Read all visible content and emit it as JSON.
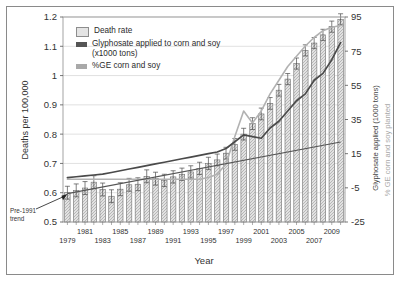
{
  "figure": {
    "frame_border_color": "#8a8a8a"
  },
  "chart_data": {
    "type": "bar",
    "title": "",
    "xlabel": "Year",
    "ylabel": "Deaths per 100,000",
    "y2label_dark": "Glyphosate applied (1000 tons)",
    "y2label_light": "% GE corn and soy planted",
    "ylim": [
      0.5,
      1.2
    ],
    "y2lim": [
      -25,
      95
    ],
    "yticks": [
      "0.5",
      "0.6",
      "0.7",
      "0.8",
      "0.9",
      "1",
      "1.1",
      "1.2"
    ],
    "ytick_values": [
      0.5,
      0.6,
      0.7,
      0.8,
      0.9,
      1.0,
      1.1,
      1.2
    ],
    "y2ticks": [
      "-25",
      "-5",
      "15",
      "35",
      "55",
      "75",
      "95"
    ],
    "y2tick_values": [
      -25,
      -5,
      15,
      35,
      55,
      75,
      95
    ],
    "grid": true,
    "legend_position": "top-left-inside",
    "categories": [
      1979,
      1980,
      1981,
      1982,
      1983,
      1984,
      1985,
      1986,
      1987,
      1988,
      1989,
      1990,
      1991,
      1992,
      1993,
      1994,
      1995,
      1996,
      1997,
      1998,
      1999,
      2000,
      2001,
      2002,
      2003,
      2004,
      2005,
      2006,
      2007,
      2008,
      2009,
      2010
    ],
    "xtick_labels_top": [
      "1981",
      "1985",
      "1989",
      "1993",
      "1997",
      "2001",
      "2005",
      "2009"
    ],
    "xtick_labels_bottom": [
      "1979",
      "1983",
      "1987",
      "1991",
      "1995",
      "1999",
      "2003",
      "2007"
    ],
    "series": [
      {
        "name": "Death rate",
        "label": "Death rate",
        "axis": "left",
        "kind": "bar",
        "color": "#d8d8d8",
        "edge": "#6f6f6f",
        "units": "deaths per 100,000",
        "values": [
          0.6,
          0.608,
          0.616,
          0.636,
          0.611,
          0.588,
          0.612,
          0.627,
          0.629,
          0.656,
          0.648,
          0.642,
          0.654,
          0.663,
          0.671,
          0.683,
          0.7,
          0.712,
          0.735,
          0.765,
          0.8,
          0.836,
          0.869,
          0.905,
          0.95,
          0.988,
          1.041,
          1.086,
          1.111,
          1.139,
          1.167,
          1.192
        ],
        "errors": [
          0.022,
          0.022,
          0.022,
          0.022,
          0.022,
          0.022,
          0.022,
          0.022,
          0.022,
          0.022,
          0.022,
          0.021,
          0.021,
          0.021,
          0.021,
          0.021,
          0.021,
          0.02,
          0.02,
          0.02,
          0.02,
          0.02,
          0.02,
          0.02,
          0.02,
          0.019,
          0.019,
          0.019,
          0.019,
          0.019,
          0.019,
          0.019
        ]
      },
      {
        "name": "Glyphosate applied to corn and soy (x1000 tons)",
        "label": "Glyphosate applied to corn and soy (x1000 tons)",
        "axis": "right",
        "kind": "line",
        "color": "#4a4a4a",
        "units": "1000 tons",
        "values": [
          1,
          1.5,
          2,
          2.5,
          3,
          4,
          5,
          6,
          7,
          8,
          9,
          10,
          11,
          12,
          13,
          14,
          15,
          16,
          18,
          22,
          26,
          25,
          24,
          30,
          34,
          40,
          46,
          50,
          58,
          62,
          70,
          80
        ]
      },
      {
        "name": "%GE corn and soy",
        "label": "%GE corn and soy",
        "axis": "right",
        "kind": "line",
        "color": "#b2b2b2",
        "units": "percent planted",
        "values": [
          0,
          0,
          0,
          0,
          0,
          0,
          0,
          0,
          0,
          0,
          0,
          0,
          0,
          0,
          0,
          0,
          1,
          3,
          9,
          25,
          40,
          33,
          40,
          50,
          58,
          66,
          72,
          78,
          83,
          87,
          89,
          90
        ]
      },
      {
        "name": "Pre-1991 trend",
        "label": "Pre-1991 trend",
        "axis": "left",
        "kind": "trendline",
        "color": "#555555",
        "start_value": 0.597,
        "end_value": 0.773
      }
    ],
    "annotation": {
      "text_line1": "Pre-1991",
      "text_line2": "trend",
      "points_to": "trend-line-start"
    }
  }
}
